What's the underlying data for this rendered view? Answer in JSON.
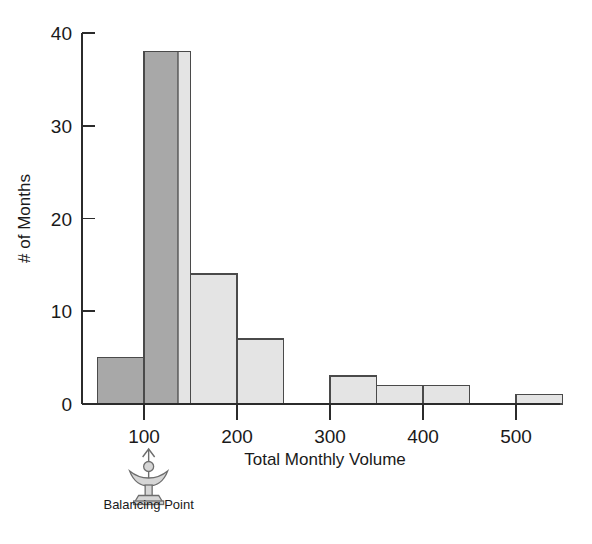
{
  "chart_data": {
    "type": "bar",
    "title": "",
    "subtitle": "",
    "xlabel": "Total Monthly Volume",
    "ylabel": "# of Months",
    "xlim": [
      50,
      560
    ],
    "ylim": [
      0,
      40
    ],
    "grid": false,
    "legend_position": "none",
    "bin_width": 50,
    "bin_edges": [
      50,
      100,
      150,
      200,
      250,
      300,
      350,
      400,
      450,
      500,
      550
    ],
    "categories": [
      "50-100",
      "100-150",
      "150-200",
      "200-250",
      "250-300",
      "300-350",
      "350-400",
      "400-450",
      "450-500",
      "500-550"
    ],
    "values": [
      5,
      38,
      14,
      7,
      0,
      3,
      2,
      2,
      0,
      1
    ],
    "bar_shading": [
      "dark",
      "dark-light-split",
      "light",
      "light",
      "light",
      "light",
      "light",
      "light",
      "light",
      "light"
    ],
    "x_ticks": [
      100,
      200,
      300,
      400,
      500
    ],
    "x_tick_labels": [
      "100",
      "200",
      "300",
      "400",
      "500"
    ],
    "y_ticks": [
      0,
      10,
      20,
      30,
      40
    ],
    "y_tick_labels": [
      "0",
      "10",
      "20",
      "30",
      "40"
    ],
    "annotations": [
      {
        "name": "balancing-point",
        "label": "Balancing Point",
        "x_value": 105,
        "icon": "fulcrum-icon"
      }
    ],
    "colors": {
      "bar_dark_fill": "#a8a8a8",
      "bar_light_fill": "#e4e4e4",
      "bar_stroke": "#4a4a4a",
      "axis": "#2b2b2b",
      "text": "#1a1a1a",
      "background": "#ffffff",
      "fulcrum": "#6d6d6d"
    }
  },
  "labels": {
    "y_axis_title": "# of Months",
    "x_axis_title": "Total Monthly Volume",
    "balancing_point": "Balancing Point"
  }
}
